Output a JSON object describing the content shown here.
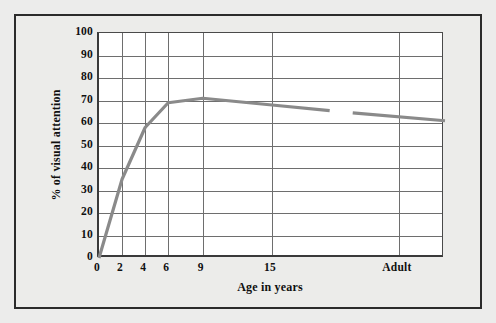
{
  "figure": {
    "background_color": "#ececeb",
    "frame_color": "#2b2b2b",
    "plot_background": "#ffffff",
    "grid_color": "#6e6e6e",
    "line_color": "#8a8a8a"
  },
  "chart_data": {
    "type": "line",
    "title": "",
    "xlabel": "Age in years",
    "ylabel": "% of visual attention",
    "xlim": [
      0,
      30
    ],
    "ylim": [
      0,
      100
    ],
    "grid": "both",
    "legend": "none",
    "ytick_labels": [
      "0",
      "10",
      "20",
      "30",
      "40",
      "50",
      "60",
      "70",
      "80",
      "90",
      "100"
    ],
    "ytick_values": [
      0,
      10,
      20,
      30,
      40,
      50,
      60,
      70,
      80,
      90,
      100
    ],
    "xtick_labels": [
      "0",
      "2",
      "4",
      "6",
      "9",
      "15",
      "Adult"
    ],
    "xtick_values": [
      0,
      2,
      4,
      6,
      9,
      15,
      26
    ],
    "series": [
      {
        "name": "% of visual attention",
        "x": [
          0,
          2,
          4,
          6,
          9,
          15,
          20
        ],
        "values": [
          0,
          35,
          58,
          69,
          71,
          68,
          65.5
        ]
      },
      {
        "name": "% of visual attention (adult segment)",
        "x": [
          22,
          30
        ],
        "values": [
          64.5,
          61
        ]
      }
    ],
    "annotations": [
      "Line is broken between age ~20 and the adult segment"
    ]
  }
}
